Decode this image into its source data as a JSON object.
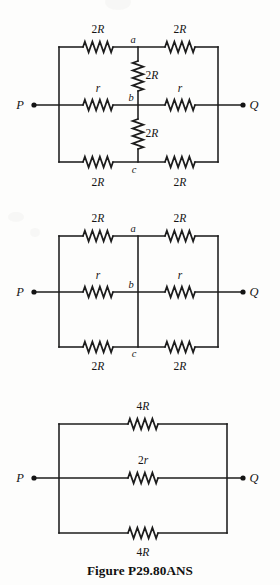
{
  "figure": {
    "caption": "Figure P29.80ANS",
    "caption_y": 563,
    "background_color": "#fdfdfc",
    "line_color": "#1c1c1c",
    "width": 280,
    "height": 585
  },
  "circuits": [
    {
      "id": "circuit-1",
      "name": "original-network-with-bridge-resistors",
      "terminals": {
        "left": {
          "label": "P",
          "label_x": 20,
          "label_y": 109,
          "dot_x": 34,
          "dot_y": 105
        },
        "right": {
          "label": "Q",
          "label_x": 254,
          "label_y": 109,
          "dot_x": 243,
          "dot_y": 105
        }
      },
      "rails": {
        "left_x": 59,
        "right_x": 218,
        "mid_x": 138,
        "top_y": 47,
        "middle_y": 105,
        "bottom_y": 162
      },
      "nodes": [
        {
          "label": "a",
          "x": 133,
          "y": 43
        },
        {
          "label": "b",
          "x": 131,
          "y": 101
        },
        {
          "label": "c",
          "x": 134,
          "y": 173
        }
      ],
      "resistors": [
        {
          "name": "top-left-resistor",
          "value": "2R",
          "orientation": "horizontal",
          "cx": 98,
          "cy": 47,
          "label_x": 98,
          "label_y": 33
        },
        {
          "name": "top-right-resistor",
          "value": "2R",
          "orientation": "horizontal",
          "cx": 180,
          "cy": 47,
          "label_x": 180,
          "label_y": 33
        },
        {
          "name": "middle-left-resistor",
          "value": "r",
          "orientation": "horizontal",
          "cx": 98,
          "cy": 105,
          "label_x": 98,
          "label_y": 92
        },
        {
          "name": "middle-right-resistor",
          "value": "r",
          "orientation": "horizontal",
          "cx": 180,
          "cy": 105,
          "label_x": 180,
          "label_y": 92
        },
        {
          "name": "bottom-left-resistor",
          "value": "2R",
          "orientation": "horizontal",
          "cx": 98,
          "cy": 162,
          "label_x": 98,
          "label_y": 186
        },
        {
          "name": "bottom-right-resistor",
          "value": "2R",
          "orientation": "horizontal",
          "cx": 180,
          "cy": 162,
          "label_x": 180,
          "label_y": 186
        },
        {
          "name": "bridge-resistor-ab",
          "value": "2R",
          "orientation": "vertical",
          "cx": 138,
          "cy": 76,
          "label_x": 152,
          "label_y": 79
        },
        {
          "name": "bridge-resistor-bc",
          "value": "2R",
          "orientation": "vertical",
          "cx": 138,
          "cy": 134,
          "label_x": 152,
          "label_y": 137
        }
      ]
    },
    {
      "id": "circuit-2",
      "name": "reduced-network-with-shorted-bridge",
      "terminals": {
        "left": {
          "label": "P",
          "label_x": 20,
          "label_y": 296,
          "dot_x": 34,
          "dot_y": 292
        },
        "right": {
          "label": "Q",
          "label_x": 254,
          "label_y": 296,
          "dot_x": 243,
          "dot_y": 292
        }
      },
      "rails": {
        "left_x": 59,
        "right_x": 218,
        "mid_x": 138,
        "top_y": 236,
        "middle_y": 292,
        "bottom_y": 347
      },
      "nodes": [
        {
          "label": "a",
          "x": 133,
          "y": 232
        },
        {
          "label": "b",
          "x": 131,
          "y": 288
        },
        {
          "label": "c",
          "x": 134,
          "y": 357
        }
      ],
      "resistors": [
        {
          "name": "top-left-resistor",
          "value": "2R",
          "orientation": "horizontal",
          "cx": 98,
          "cy": 236,
          "label_x": 98,
          "label_y": 222
        },
        {
          "name": "top-right-resistor",
          "value": "2R",
          "orientation": "horizontal",
          "cx": 180,
          "cy": 236,
          "label_x": 180,
          "label_y": 222
        },
        {
          "name": "middle-left-resistor",
          "value": "r",
          "orientation": "horizontal",
          "cx": 98,
          "cy": 292,
          "label_x": 98,
          "label_y": 279
        },
        {
          "name": "middle-right-resistor",
          "value": "r",
          "orientation": "horizontal",
          "cx": 180,
          "cy": 292,
          "label_x": 180,
          "label_y": 279
        },
        {
          "name": "bottom-left-resistor",
          "value": "2R",
          "orientation": "horizontal",
          "cx": 98,
          "cy": 347,
          "label_x": 98,
          "label_y": 370
        },
        {
          "name": "bottom-right-resistor",
          "value": "2R",
          "orientation": "horizontal",
          "cx": 180,
          "cy": 347,
          "label_x": 180,
          "label_y": 370
        }
      ],
      "bridge_wire": {
        "name": "shorting-wire-abc",
        "x": 138,
        "y1": 236,
        "y2": 347
      }
    },
    {
      "id": "circuit-3",
      "name": "final-three-branch-parallel-network",
      "terminals": {
        "left": {
          "label": "P",
          "label_x": 20,
          "label_y": 482,
          "dot_x": 34,
          "dot_y": 478
        },
        "right": {
          "label": "Q",
          "label_x": 254,
          "label_y": 482,
          "dot_x": 243,
          "dot_y": 478
        }
      },
      "rails": {
        "left_x": 59,
        "right_x": 227,
        "top_y": 424,
        "middle_y": 478,
        "bottom_y": 533
      },
      "nodes": [],
      "resistors": [
        {
          "name": "top-branch-resistor",
          "value": "4R",
          "orientation": "horizontal",
          "cx": 143,
          "cy": 424,
          "label_x": 143,
          "label_y": 410
        },
        {
          "name": "middle-branch-resistor",
          "value": "2r",
          "orientation": "horizontal",
          "cx": 143,
          "cy": 478,
          "label_x": 143,
          "label_y": 464
        },
        {
          "name": "bottom-branch-resistor",
          "value": "4R",
          "orientation": "horizontal",
          "cx": 143,
          "cy": 533,
          "label_x": 143,
          "label_y": 556
        }
      ]
    }
  ]
}
